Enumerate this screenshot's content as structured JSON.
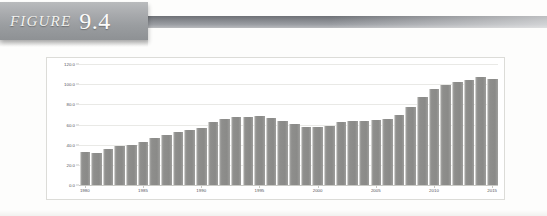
{
  "header": {
    "figure_word": "FIGURE",
    "figure_number": "9.4",
    "tab_color": "#9a9da0",
    "rule_color": "#85888d"
  },
  "chart_data": {
    "type": "bar",
    "title": "",
    "subtitle": "",
    "xlabel": "",
    "ylabel": "",
    "grid": true,
    "legend": "none",
    "bar_color": "#8e8e8c",
    "ylim": [
      0,
      120
    ],
    "yticks": [
      0.0,
      20.0,
      40.0,
      60.0,
      80.0,
      100.0,
      120.0
    ],
    "ytick_labels": [
      "0.0",
      "20.0",
      "40.0",
      "60.0",
      "80.0",
      "100.0",
      "120.0"
    ],
    "xtick_labels": [
      "1980",
      "1985",
      "1990",
      "1995",
      "2000",
      "2005",
      "2010",
      "2015"
    ],
    "categories": [
      "1980",
      "1981",
      "1982",
      "1983",
      "1984",
      "1985",
      "1986",
      "1987",
      "1988",
      "1989",
      "1990",
      "1991",
      "1992",
      "1993",
      "1994",
      "1995",
      "1996",
      "1997",
      "1998",
      "1999",
      "2000",
      "2001",
      "2002",
      "2003",
      "2004",
      "2005",
      "2006",
      "2007",
      "2008",
      "2009",
      "2010",
      "2011",
      "2012",
      "2013",
      "2014",
      "2015"
    ],
    "values": [
      33.0,
      32.0,
      36.0,
      39.0,
      40.0,
      43.0,
      47.0,
      50.0,
      53.0,
      55.0,
      57.0,
      62.0,
      65.0,
      67.0,
      67.5,
      68.0,
      66.0,
      63.0,
      61.0,
      58.0,
      57.5,
      59.0,
      62.0,
      63.0,
      63.5,
      64.0,
      65.0,
      69.0,
      77.0,
      87.0,
      95.0,
      99.0,
      102.0,
      104.0,
      107.0,
      105.0
    ]
  }
}
